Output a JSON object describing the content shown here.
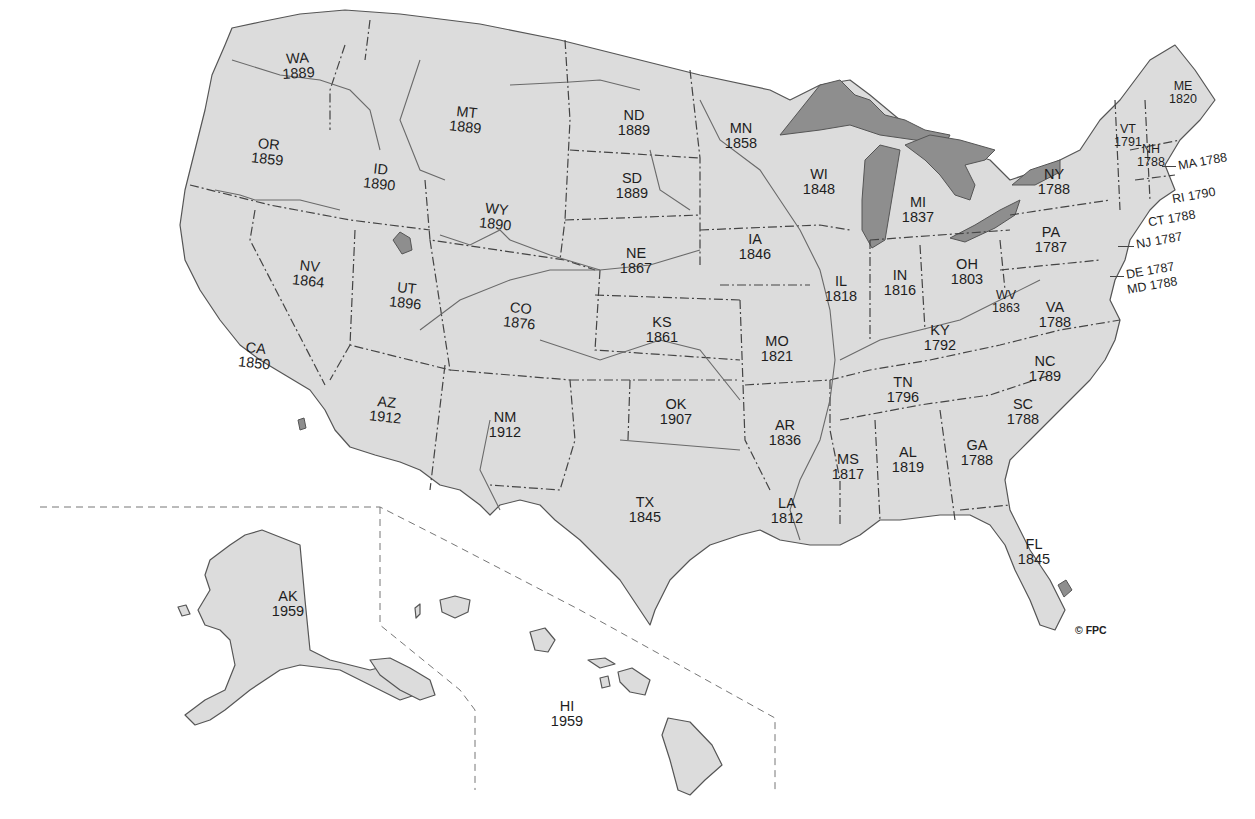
{
  "map": {
    "type": "United States statehood dates",
    "colors": {
      "land": "#dcdcdc",
      "water_lakes": "#8e8e8e",
      "background": "#ffffff",
      "text": "#1e1e1e"
    },
    "copyright": "© FPC",
    "states": [
      {
        "abbr": "WA",
        "year": "1889"
      },
      {
        "abbr": "OR",
        "year": "1859"
      },
      {
        "abbr": "ID",
        "year": "1890"
      },
      {
        "abbr": "MT",
        "year": "1889"
      },
      {
        "abbr": "ND",
        "year": "1889"
      },
      {
        "abbr": "SD",
        "year": "1889"
      },
      {
        "abbr": "MN",
        "year": "1858"
      },
      {
        "abbr": "WI",
        "year": "1848"
      },
      {
        "abbr": "MI",
        "year": "1837"
      },
      {
        "abbr": "NY",
        "year": "1788"
      },
      {
        "abbr": "VT",
        "year": "1791"
      },
      {
        "abbr": "NH",
        "year": "1788"
      },
      {
        "abbr": "ME",
        "year": "1820"
      },
      {
        "abbr": "MA",
        "year": "1788"
      },
      {
        "abbr": "RI",
        "year": "1790"
      },
      {
        "abbr": "CT",
        "year": "1788"
      },
      {
        "abbr": "NJ",
        "year": "1787"
      },
      {
        "abbr": "DE",
        "year": "1787"
      },
      {
        "abbr": "MD",
        "year": "1788"
      },
      {
        "abbr": "PA",
        "year": "1787"
      },
      {
        "abbr": "WY",
        "year": "1890"
      },
      {
        "abbr": "NE",
        "year": "1867"
      },
      {
        "abbr": "IA",
        "year": "1846"
      },
      {
        "abbr": "IL",
        "year": "1818"
      },
      {
        "abbr": "IN",
        "year": "1816"
      },
      {
        "abbr": "OH",
        "year": "1803"
      },
      {
        "abbr": "WV",
        "year": "1863"
      },
      {
        "abbr": "VA",
        "year": "1788"
      },
      {
        "abbr": "KY",
        "year": "1792"
      },
      {
        "abbr": "NV",
        "year": "1864"
      },
      {
        "abbr": "UT",
        "year": "1896"
      },
      {
        "abbr": "CO",
        "year": "1876"
      },
      {
        "abbr": "KS",
        "year": "1861"
      },
      {
        "abbr": "MO",
        "year": "1821"
      },
      {
        "abbr": "CA",
        "year": "1850"
      },
      {
        "abbr": "AZ",
        "year": "1912"
      },
      {
        "abbr": "NM",
        "year": "1912"
      },
      {
        "abbr": "OK",
        "year": "1907"
      },
      {
        "abbr": "AR",
        "year": "1836"
      },
      {
        "abbr": "TN",
        "year": "1796"
      },
      {
        "abbr": "NC",
        "year": "1789"
      },
      {
        "abbr": "SC",
        "year": "1788"
      },
      {
        "abbr": "GA",
        "year": "1788"
      },
      {
        "abbr": "AL",
        "year": "1819"
      },
      {
        "abbr": "MS",
        "year": "1817"
      },
      {
        "abbr": "LA",
        "year": "1812"
      },
      {
        "abbr": "TX",
        "year": "1845"
      },
      {
        "abbr": "FL",
        "year": "1845"
      },
      {
        "abbr": "AK",
        "year": "1959"
      },
      {
        "abbr": "HI",
        "year": "1959"
      }
    ]
  }
}
